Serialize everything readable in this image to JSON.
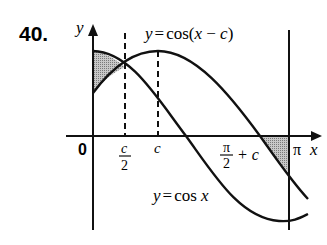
{
  "problem_number": "40.",
  "axes": {
    "x_label": "x",
    "y_label": "y",
    "origin_label": "0"
  },
  "curves": [
    {
      "name": "cos-shifted",
      "label_prefix": "y",
      "label_eq": "=",
      "label_func": "cos(",
      "label_var": "x",
      "label_minus": " − ",
      "label_c": "c",
      "label_close": ")"
    },
    {
      "name": "cos",
      "label_prefix": "y",
      "label_eq": "=",
      "label_func": "cos ",
      "label_var": "x"
    }
  ],
  "ticks": {
    "c_half_num": "c",
    "c_half_den": "2",
    "c": "c",
    "pi_half_plus_c_num": "π",
    "pi_half_plus_c_den": "2",
    "pi_half_plus_c_suffix": "+ c",
    "pi": "π"
  },
  "colors": {
    "stroke": "#111111",
    "shade": "#9a9a9a"
  }
}
